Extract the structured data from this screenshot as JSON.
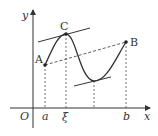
{
  "diagram": {
    "axes": {
      "x_label": "x",
      "y_label": "y",
      "origin_label": "O"
    },
    "points": [
      {
        "name": "A",
        "label": "A",
        "x": 45,
        "y": 65
      },
      {
        "name": "C",
        "label": "C",
        "x": 66,
        "y": 34
      },
      {
        "name": "B",
        "label": "B",
        "x": 126,
        "y": 42
      }
    ],
    "x_ticks": [
      {
        "label": "a",
        "x": 45
      },
      {
        "label": "ξ",
        "x": 66
      },
      {
        "label": "b",
        "x": 126
      }
    ],
    "elements": [
      "curve",
      "secant AB (dashed)",
      "tangent at C",
      "tangent at local minimum",
      "dashed projections"
    ],
    "colors": {
      "line": "#333333",
      "background": "#ffffff"
    }
  }
}
